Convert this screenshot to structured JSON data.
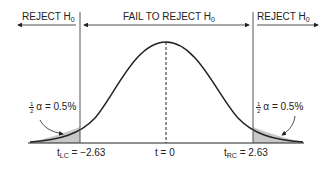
{
  "diagram": {
    "type": "two-tailed t-distribution hypothesis test",
    "regions": {
      "left": "REJECT H",
      "center": "FAIL TO REJECT H",
      "right": "REJECT H",
      "subscript": "0"
    },
    "tail_labels": {
      "left": {
        "fraction_num": "1",
        "fraction_den": "2",
        "text": "α = 0.5%"
      },
      "right": {
        "fraction_num": "1",
        "fraction_den": "2",
        "text": "α = 0.5%"
      }
    },
    "axis_labels": {
      "left_critical": {
        "t": "t",
        "sub": "LC",
        "value": " = −2.63"
      },
      "center": "t = 0",
      "right_critical": {
        "t": "t",
        "sub": "RC",
        "value": " = 2.63"
      }
    },
    "colors": {
      "line": "#222222",
      "shade": "#bfbfbf",
      "divider": "#555555"
    }
  }
}
